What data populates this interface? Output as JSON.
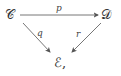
{
  "diagram": {
    "type": "commutative-diagram",
    "nodes": {
      "C": "𝒞",
      "D": "𝒟",
      "E": "ℰ,"
    },
    "arrows": {
      "p": {
        "label": "p",
        "from": "C",
        "to": "D"
      },
      "q": {
        "label": "q",
        "from": "C",
        "to": "E"
      },
      "r": {
        "label": "r",
        "from": "D",
        "to": "E"
      }
    }
  }
}
